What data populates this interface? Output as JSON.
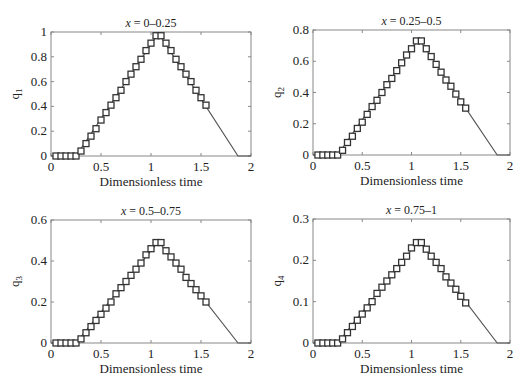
{
  "chart_data": [
    {
      "type": "line",
      "title": "x = 0–0.25",
      "title_var": "x",
      "title_range": " = 0–0.25",
      "xlabel": "Dimensionless time",
      "ylabel": "q1",
      "ylabel_base": "q",
      "ylabel_sub": "1",
      "xlim": [
        0,
        2
      ],
      "ylim": [
        0,
        1
      ],
      "xticks": [
        "0",
        "0.5",
        "1",
        "1.5",
        "2"
      ],
      "yticks": [
        "0",
        "0.2",
        "0.4",
        "0.6",
        "0.8",
        "1"
      ],
      "ytick_values": [
        0,
        0.2,
        0.4,
        0.6,
        0.8,
        1
      ],
      "grid": false,
      "line": {
        "x": [
          0,
          0.25,
          1.075,
          1.87,
          2
        ],
        "y": [
          0,
          0,
          0.99,
          0,
          0
        ]
      },
      "markers": {
        "style": "square",
        "x": [
          0.05,
          0.1,
          0.15,
          0.2,
          0.25,
          0.3,
          0.35,
          0.4,
          0.45,
          0.5,
          0.55,
          0.6,
          0.65,
          0.7,
          0.75,
          0.8,
          0.85,
          0.9,
          0.95,
          1.0,
          1.05,
          1.1,
          1.15,
          1.2,
          1.25,
          1.3,
          1.35,
          1.4,
          1.45,
          1.5,
          1.55
        ],
        "y": [
          0,
          0,
          0,
          0,
          0,
          0.04,
          0.1,
          0.16,
          0.22,
          0.29,
          0.35,
          0.41,
          0.47,
          0.53,
          0.6,
          0.66,
          0.72,
          0.78,
          0.85,
          0.91,
          0.97,
          0.97,
          0.91,
          0.85,
          0.78,
          0.72,
          0.66,
          0.6,
          0.53,
          0.47,
          0.41
        ]
      }
    },
    {
      "type": "line",
      "title": "x = 0.25–0.5",
      "title_var": "x",
      "title_range": " = 0.25–0.5",
      "xlabel": "Dimensionless time",
      "ylabel": "q2",
      "ylabel_base": "q",
      "ylabel_sub": "2",
      "xlim": [
        0,
        2
      ],
      "ylim": [
        0,
        0.8
      ],
      "xticks": [
        "0",
        "0.5",
        "1",
        "1.5",
        "2"
      ],
      "yticks": [
        "0",
        "0.2",
        "0.4",
        "0.6",
        "0.8"
      ],
      "ytick_values": [
        0,
        0.2,
        0.4,
        0.6,
        0.8
      ],
      "grid": false,
      "line": {
        "x": [
          0,
          0.25,
          1.075,
          1.87,
          2
        ],
        "y": [
          0,
          0,
          0.745,
          0,
          0
        ]
      },
      "markers": {
        "style": "square",
        "x": [
          0.05,
          0.1,
          0.15,
          0.2,
          0.25,
          0.3,
          0.35,
          0.4,
          0.45,
          0.5,
          0.55,
          0.6,
          0.65,
          0.7,
          0.75,
          0.8,
          0.85,
          0.9,
          0.95,
          1.0,
          1.05,
          1.1,
          1.15,
          1.2,
          1.25,
          1.3,
          1.35,
          1.4,
          1.45,
          1.5,
          1.55
        ],
        "y": [
          0,
          0,
          0,
          0,
          0,
          0.03,
          0.08,
          0.12,
          0.17,
          0.21,
          0.26,
          0.31,
          0.35,
          0.4,
          0.45,
          0.49,
          0.54,
          0.59,
          0.64,
          0.68,
          0.73,
          0.73,
          0.68,
          0.63,
          0.58,
          0.53,
          0.48,
          0.44,
          0.39,
          0.34,
          0.3
        ]
      }
    },
    {
      "type": "line",
      "title": "x = 0.5–0.75",
      "title_var": "x",
      "title_range": " = 0.5–0.75",
      "xlabel": "Dimensionless time",
      "ylabel": "q3",
      "ylabel_base": "q",
      "ylabel_sub": "3",
      "xlim": [
        0,
        2
      ],
      "ylim": [
        0,
        0.6
      ],
      "xticks": [
        "0",
        "0.5",
        "1",
        "1.5",
        "2"
      ],
      "yticks": [
        "0",
        "0.2",
        "0.4",
        "0.6"
      ],
      "ytick_values": [
        0,
        0.2,
        0.4,
        0.6
      ],
      "grid": false,
      "line": {
        "x": [
          0,
          0.25,
          1.075,
          1.87,
          2
        ],
        "y": [
          0,
          0,
          0.495,
          0,
          0
        ]
      },
      "markers": {
        "style": "square",
        "x": [
          0.05,
          0.1,
          0.15,
          0.2,
          0.25,
          0.3,
          0.35,
          0.4,
          0.45,
          0.5,
          0.55,
          0.6,
          0.65,
          0.7,
          0.75,
          0.8,
          0.85,
          0.9,
          0.95,
          1.0,
          1.05,
          1.1,
          1.15,
          1.2,
          1.25,
          1.3,
          1.35,
          1.4,
          1.45,
          1.5,
          1.55
        ],
        "y": [
          0,
          0,
          0,
          0,
          0,
          0.02,
          0.05,
          0.08,
          0.11,
          0.14,
          0.17,
          0.2,
          0.24,
          0.27,
          0.3,
          0.33,
          0.36,
          0.39,
          0.43,
          0.46,
          0.49,
          0.49,
          0.45,
          0.42,
          0.39,
          0.36,
          0.32,
          0.29,
          0.26,
          0.23,
          0.2
        ]
      }
    },
    {
      "type": "line",
      "title": "x = 0.75–1",
      "title_var": "x",
      "title_range": " = 0.75–1",
      "xlabel": "Dimensionless time",
      "ylabel": "q4",
      "ylabel_base": "q",
      "ylabel_sub": "4",
      "xlim": [
        0,
        2
      ],
      "ylim": [
        0,
        0.3
      ],
      "xticks": [
        "0",
        "0.5",
        "1",
        "1.5",
        "2"
      ],
      "yticks": [
        "0",
        "0.1",
        "0.2",
        "0.3"
      ],
      "ytick_values": [
        0,
        0.1,
        0.2,
        0.3
      ],
      "grid": false,
      "line": {
        "x": [
          0,
          0.25,
          1.075,
          1.87,
          2
        ],
        "y": [
          0,
          0,
          0.248,
          0,
          0
        ]
      },
      "markers": {
        "style": "square",
        "x": [
          0.05,
          0.1,
          0.15,
          0.2,
          0.25,
          0.3,
          0.35,
          0.4,
          0.45,
          0.5,
          0.55,
          0.6,
          0.65,
          0.7,
          0.75,
          0.8,
          0.85,
          0.9,
          0.95,
          1.0,
          1.05,
          1.1,
          1.15,
          1.2,
          1.25,
          1.3,
          1.35,
          1.4,
          1.45,
          1.5,
          1.55
        ],
        "y": [
          0,
          0,
          0,
          0,
          0,
          0.01,
          0.025,
          0.04,
          0.055,
          0.07,
          0.085,
          0.1,
          0.12,
          0.135,
          0.15,
          0.165,
          0.18,
          0.195,
          0.21,
          0.23,
          0.243,
          0.243,
          0.227,
          0.21,
          0.195,
          0.18,
          0.16,
          0.145,
          0.13,
          0.113,
          0.097
        ]
      }
    }
  ],
  "colors": {
    "line": "#555555",
    "marker_edge": "#333333",
    "axis": "#888888",
    "text": "#222222"
  }
}
